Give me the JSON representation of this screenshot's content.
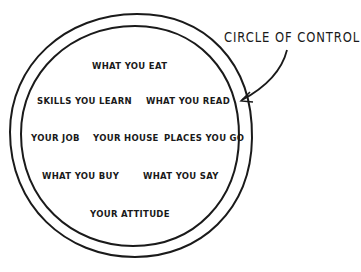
{
  "diagram": {
    "title": "CIRCLE OF CONTROL",
    "items": [
      "WHAT YOU EAT",
      "SKILLS YOU LEARN",
      "WHAT YOU READ",
      "YOUR JOB",
      "YOUR HOUSE",
      "PLACES YOU GO",
      "WHAT YOU BUY",
      "WHAT YOU SAY",
      "YOUR ATTITUDE"
    ],
    "stroke_color": "#1a1a1a",
    "background_color": "#ffffff"
  }
}
